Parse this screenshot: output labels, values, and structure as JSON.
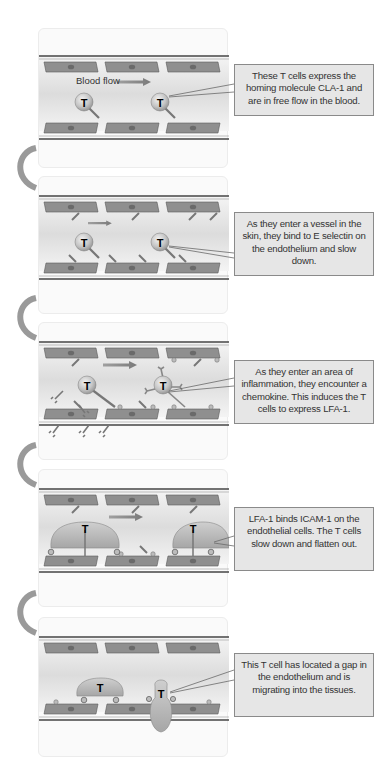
{
  "steps": [
    {
      "id": 1,
      "label_in_panel": "Blood flow",
      "callout": "These T cells express the homing molecule CLA-1 and are in free flow in the blood."
    },
    {
      "id": 2,
      "callout": "As they enter a vessel in the skin, they bind to E selectin on the endothelium and slow down."
    },
    {
      "id": 3,
      "callout": "As they enter an area of inflammation, they encounter a chemokine. This induces the T cells to express LFA-1."
    },
    {
      "id": 4,
      "callout": "LFA-1 binds ICAM-1 on the endothelial cells. The T cells slow down and flatten out."
    },
    {
      "id": 5,
      "callout": "This T cell has located a gap in the endothelium and is migrating into the tissues."
    }
  ],
  "cell_label": "T",
  "colors": {
    "endothelium": "#8c8c8c",
    "nucleus": "#6e6e6e",
    "tcell": "#bdbdbd",
    "arrow": "#8a8a8a",
    "callout_bg": "#e6e6e6",
    "vessel_line": "#444444"
  }
}
